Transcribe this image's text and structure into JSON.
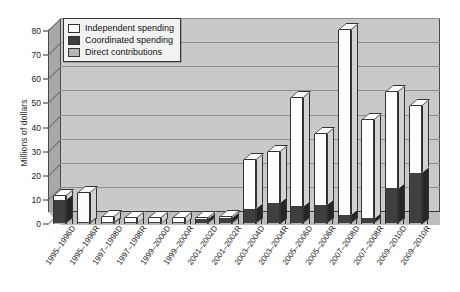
{
  "chart_data": {
    "type": "bar",
    "stacked": true,
    "three_d": true,
    "title": "",
    "xlabel": "",
    "ylabel": "Millions of dollars",
    "ylim": [
      0,
      80
    ],
    "ytick_step": 10,
    "yticks": [
      0,
      10,
      20,
      30,
      40,
      50,
      60,
      70,
      80
    ],
    "grid": true,
    "legend_position": "top-left-inside",
    "categories": [
      "1995–1996D",
      "1995–1996R",
      "1997–1998D",
      "1997–1998R",
      "1999–2000D",
      "1999–2000R",
      "2001–2002D",
      "2001–2002R",
      "2003–2004D",
      "2003–2004R",
      "2005–2006D",
      "2005–2006R",
      "2007–2008D",
      "2007–2008R",
      "2009–2010D",
      "2009–2010R"
    ],
    "series": [
      {
        "name": "Direct contributions",
        "color": "#b5b5b5",
        "values": [
          0.5,
          0.5,
          0.5,
          0.4,
          0.4,
          0.4,
          0.4,
          0.4,
          0.4,
          0.4,
          0.3,
          0.3,
          0.3,
          0.3,
          0.3,
          0.3
        ]
      },
      {
        "name": "Coordinated spending",
        "color": "#3f3f3f",
        "values": [
          9.5,
          0.3,
          0.3,
          0.3,
          0.3,
          0.3,
          1.6,
          2.2,
          6.0,
          8.5,
          7.0,
          7.5,
          3.5,
          2.0,
          14.5,
          21.0
        ]
      },
      {
        "name": "Independent spending",
        "color": "#ffffff",
        "values": [
          1.5,
          12.0,
          2.0,
          2.0,
          2.0,
          2.0,
          0.3,
          0.3,
          20.0,
          21.0,
          45.0,
          29.5,
          76.5,
          41.0,
          40.0,
          27.5
        ]
      }
    ],
    "totals": [
      11.5,
      12.8,
      2.8,
      2.7,
      2.7,
      2.7,
      2.3,
      2.9,
      26.4,
      29.9,
      52.3,
      37.3,
      80.3,
      43.3,
      54.8,
      48.8
    ]
  },
  "legend": {
    "items": [
      {
        "label": "Independent spending",
        "key": "independent"
      },
      {
        "label": "Coordinated spending",
        "key": "coordinated"
      },
      {
        "label": "Direct contributions",
        "key": "direct"
      }
    ]
  },
  "colors": {
    "plot_background": "#c9c9c9",
    "side_wall": "#a8a8a8",
    "floor": "#bdbdbd",
    "gridline": "#8e8e8e",
    "axis": "#2b2b2b",
    "independent": "#ffffff",
    "coordinated": "#3f3f3f",
    "direct": "#b5b5b5"
  }
}
